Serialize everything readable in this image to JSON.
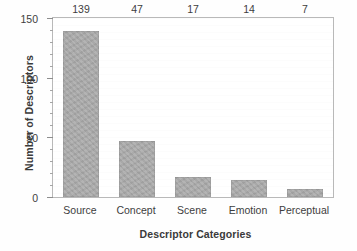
{
  "chart_data": {
    "type": "bar",
    "title": "",
    "xlabel": "Descriptor Categories",
    "ylabel": "Number of Descriptors",
    "categories": [
      "Source",
      "Concept",
      "Scene",
      "Emotion",
      "Perceptual"
    ],
    "values": [
      139,
      47,
      17,
      14,
      7
    ],
    "value_labels": [
      "139",
      "47",
      "17",
      "14",
      "7"
    ],
    "ylim": [
      0,
      150
    ],
    "yticks": [
      0,
      50,
      100,
      150
    ],
    "ytick_labels": [
      "0",
      "50",
      "100",
      "150"
    ],
    "yminor_step": 10,
    "grid": false,
    "legend": null,
    "bar_color": "#ababab",
    "frame_color": "#b9b9b9",
    "text_color": "#3d3d3d",
    "background": "#ffffff"
  }
}
